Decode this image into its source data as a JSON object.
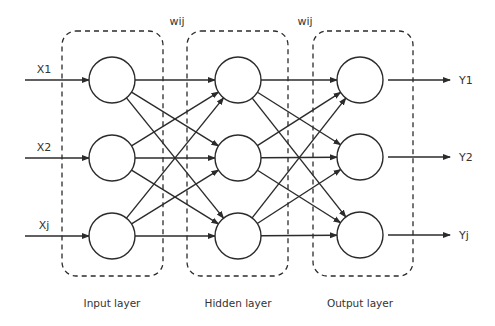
{
  "diagram": {
    "colors": {
      "stroke": "#2b2b2b",
      "text": "#333333",
      "background": "#ffffff"
    },
    "weights_labels": [
      {
        "text": "wij",
        "x": 177,
        "y": 25
      },
      {
        "text": "wij",
        "x": 305,
        "y": 25
      }
    ],
    "inputs": [
      {
        "label": "X1",
        "y": 80
      },
      {
        "label": "X2",
        "y": 158
      },
      {
        "label": "Xj",
        "y": 236
      }
    ],
    "outputs": [
      {
        "label": "Y1",
        "y": 80
      },
      {
        "label": "Y2",
        "y": 157
      },
      {
        "label": "Yj",
        "y": 235
      }
    ],
    "layers": [
      {
        "name": "Input layer",
        "cx": 112,
        "box": [
          62,
          31,
          101,
          245
        ],
        "nodes": [
          80,
          158,
          236
        ]
      },
      {
        "name": "Hidden layer",
        "cx": 238,
        "box": [
          187,
          31,
          101,
          245
        ],
        "nodes": [
          80,
          158,
          236
        ]
      },
      {
        "name": "Output layer",
        "cx": 360,
        "box": [
          313,
          31,
          100,
          245
        ],
        "nodes": [
          80,
          157,
          235
        ]
      }
    ],
    "node_radius": 23,
    "connections": "fully connected between adjacent layers"
  }
}
